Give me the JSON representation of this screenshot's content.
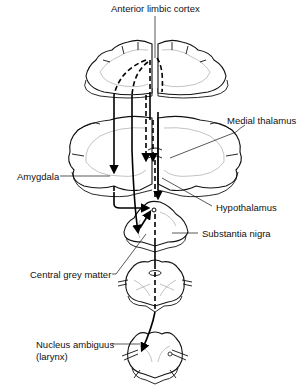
{
  "diagram": {
    "type": "neuroanatomical pathway diagram",
    "labels": {
      "anterior_limbic_cortex": "Anterior limbic cortex",
      "medial_thalamus": "Medial thalamus",
      "amygdala": "Amygdala",
      "hypothalamus": "Hypothalamus",
      "substantia_nigra": "Substantia nigra",
      "central_grey_matter": "Central grey matter",
      "nucleus_ambiguus": "Nucleus ambiguus",
      "nucleus_ambiguus_sub": "(larynx)"
    },
    "sections": [
      "cortex",
      "forebrain/thalamus",
      "midbrain",
      "pons",
      "medulla"
    ],
    "line_styles": {
      "solid": "#000000",
      "dashed": "#000000"
    }
  }
}
